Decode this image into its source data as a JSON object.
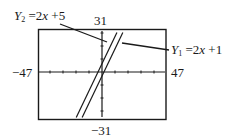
{
  "chart_data": {
    "type": "line",
    "title": "",
    "xlabel": "",
    "ylabel": "",
    "xlim": [
      -47,
      47
    ],
    "ylim": [
      -31,
      31
    ],
    "grid": false,
    "axes": {
      "x_ticks": true,
      "y_ticks": true,
      "tick_spacing_px": 13
    },
    "window_labels": {
      "xmin": "−47",
      "xmax": "47",
      "ymin": "−31",
      "ymax": "31"
    },
    "series": [
      {
        "name": "Y1 = 2x + 1",
        "slope": 2,
        "intercept": 1,
        "label": {
          "var": "Y",
          "sub": "1",
          "rhs_coef": "2",
          "rhs_var": "x",
          "rhs_op": "+",
          "rhs_const": "1"
        }
      },
      {
        "name": "Y2 = 2x + 5",
        "slope": 2,
        "intercept": 5,
        "label": {
          "var": "Y",
          "sub": "2",
          "rhs_coef": "2",
          "rhs_var": "x",
          "rhs_op": "+",
          "rhs_const": "5"
        }
      }
    ],
    "annotations": [
      "Y2 = 2x + 5 (leader to upper line)",
      "Y1 = 2x + 1 (leader to lower line)"
    ]
  },
  "colors": {
    "ink": "#1a1a1a",
    "background": "#ffffff"
  }
}
